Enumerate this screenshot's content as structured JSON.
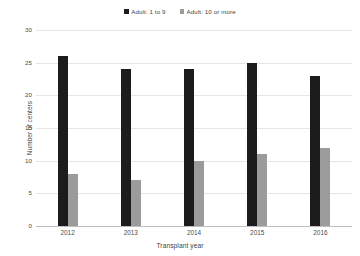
{
  "chart_data": {
    "type": "bar",
    "title": "",
    "subtitle": "",
    "xlabel": "Transplant year",
    "ylabel": "Number of centers",
    "categories": [
      "2012",
      "2013",
      "2014",
      "2015",
      "2016"
    ],
    "series": [
      {
        "name": "Adult: 1 to 9",
        "color": "#1c1c1c",
        "values": [
          26,
          24,
          24,
          25,
          23
        ]
      },
      {
        "name": "Adult: 10 or more",
        "color": "#9b9b9b",
        "values": [
          8,
          7,
          10,
          11,
          12
        ]
      }
    ],
    "ylim": [
      0,
      30
    ],
    "yticks": [
      0,
      5,
      10,
      15,
      20,
      25,
      30
    ],
    "ytick_labels": [
      "0",
      "5",
      "10",
      "15",
      "20",
      "25",
      "30"
    ],
    "grid": true,
    "grid_axis": "y",
    "legend_position": "top-center",
    "background": "#ffffff",
    "gridline_color": "#e6e6e6",
    "axis_color": "#bfbfbf",
    "text_color": "#3f3f3f"
  },
  "legend": {
    "items": [
      {
        "label": "Adult: 1 to 9",
        "color": "#1c1c1c"
      },
      {
        "label": "Adult: 10 or more",
        "color": "#9b9b9b"
      }
    ]
  }
}
